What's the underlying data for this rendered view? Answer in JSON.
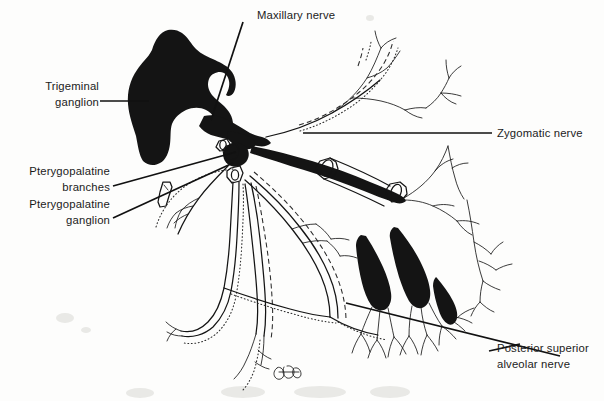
{
  "figure": {
    "type": "anatomical line drawing",
    "width": 604,
    "height": 401,
    "background_color": "#fdfdfc",
    "ink_color": "#141414"
  },
  "labels": {
    "maxillary_nerve": "Maxillary nerve",
    "trigeminal_ganglion_line1": "Trigeminal",
    "trigeminal_ganglion_line2": "ganglion",
    "pterygopalatine_branches_line1": "Pterygopalatine",
    "pterygopalatine_branches_line2": "branches",
    "pterygopalatine_ganglion_line1": "Pterygopalatine",
    "pterygopalatine_ganglion_line2": "ganglion",
    "zygomatic_nerve": "Zygomatic nerve",
    "posterior_superior_alveolar_line1": "Posterior superior",
    "posterior_superior_alveolar_line2": "alveolar nerve"
  },
  "structures": [
    {
      "name": "trigeminal-ganglion",
      "style": "solid-black-mass",
      "description": "large irregular filled ganglion at upper left"
    },
    {
      "name": "maxillary-nerve-trunk",
      "style": "solid-black-trunk",
      "description": "thick trunk running from ganglion to the right"
    },
    {
      "name": "zygomatic-nerve",
      "style": "thin-branching",
      "description": "upward branching nerve at upper right"
    },
    {
      "name": "infraorbital-nerve",
      "style": "solid-trunk-with-cut-sleeve",
      "description": "trunk to the right with cut-away cylinder sections"
    },
    {
      "name": "pterygopalatine-ganglion",
      "style": "small-node",
      "description": "junction node below the maxillary trunk"
    },
    {
      "name": "greater-palatine-nerve",
      "style": "outlined-descending",
      "description": "descending outlined nerve with dotted bone canal"
    },
    {
      "name": "lesser-palatine-nerve",
      "style": "outlined-descending",
      "description": "second descending outlined nerve"
    },
    {
      "name": "posterior-superior-alveolar-nerve",
      "style": "tooth-root-plexus",
      "description": "tooth roots with nerve plexus at lower right"
    },
    {
      "name": "artist-signature",
      "style": "scribble",
      "description": "small initials mark at bottom centre"
    }
  ]
}
